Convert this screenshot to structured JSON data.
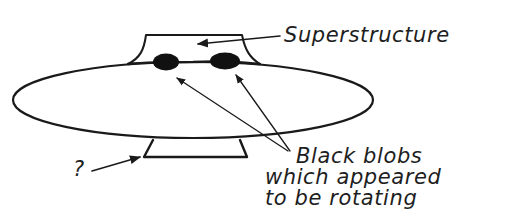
{
  "diagram": {
    "labels": {
      "superstructure": "Superstructure",
      "blobs_line1": "Black blobs",
      "blobs_line2": "which appeared",
      "blobs_line3": "to be rotating",
      "unknown": "?"
    },
    "colors": {
      "ink": "#1a1a1a",
      "background": "#ffffff"
    }
  }
}
